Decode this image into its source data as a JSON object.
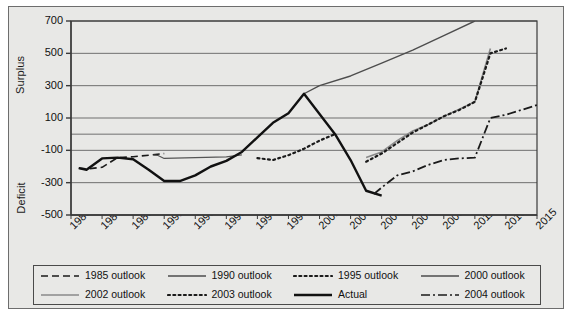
{
  "chart_data": {
    "type": "line",
    "title": "",
    "xlabel": "",
    "ylabel": "Surplus / Deficit",
    "axis_titles": {
      "upper": "Surplus",
      "lower": "Deficit"
    },
    "grid": true,
    "legend_position": "bottom",
    "xlim": [
      1985,
      2015
    ],
    "ylim": [
      -500,
      700
    ],
    "ytick_labels": [
      "700",
      "500",
      "300",
      "100",
      "-100",
      "-300",
      "-500"
    ],
    "ytick_values": [
      700,
      500,
      300,
      100,
      -100,
      -300,
      -500
    ],
    "zero_gridline": 0,
    "xtick_labels": [
      "1985",
      "1987",
      "1989",
      "1991",
      "1993",
      "1995",
      "1997",
      "1999",
      "2001",
      "2003",
      "2005",
      "2007",
      "2009",
      "2011",
      "2013",
      "2015"
    ],
    "xtick_values": [
      1985,
      1987,
      1989,
      1991,
      1993,
      1995,
      1997,
      1999,
      2001,
      2003,
      2005,
      2007,
      2009,
      2011,
      2013,
      2015
    ],
    "series": [
      {
        "name": "1985 outlook",
        "style": "dashed",
        "color": "#1a1a1a",
        "width": 1.6,
        "x": [
          1985.5,
          1986,
          1987,
          1988,
          1989,
          1990,
          1991
        ],
        "values": [
          -210,
          -215,
          -205,
          -145,
          -140,
          -130,
          -120
        ]
      },
      {
        "name": "1990 outlook",
        "style": "solid",
        "color": "#555555",
        "width": 1.2,
        "x": [
          1990.3,
          1990.6,
          1991,
          1993,
          1995,
          1996
        ],
        "values": [
          -130,
          -132,
          -150,
          -145,
          -140,
          -128
        ]
      },
      {
        "name": "1995 outlook",
        "style": "dotted",
        "color": "#1a1a1a",
        "width": 2.2,
        "x": [
          1997,
          1998,
          1999,
          2000,
          2001,
          2002
        ],
        "values": [
          -148,
          -160,
          -130,
          -90,
          -40,
          0
        ]
      },
      {
        "name": "2000 outlook",
        "style": "solid",
        "color": "#4d4d4d",
        "width": 1.4,
        "x": [
          2000,
          2001,
          2003,
          2005,
          2007,
          2009,
          2011
        ],
        "values": [
          250,
          300,
          360,
          440,
          520,
          610,
          700
        ]
      },
      {
        "name": "2002 outlook",
        "style": "solid",
        "color": "#8a8a8a",
        "width": 1.6,
        "x": [
          2004,
          2005,
          2006,
          2007,
          2008,
          2009,
          2010,
          2011,
          2012
        ],
        "values": [
          -145,
          -110,
          -40,
          20,
          60,
          110,
          155,
          200,
          530
        ]
      },
      {
        "name": "2003 outlook",
        "style": "dotted",
        "color": "#1a1a1a",
        "width": 2.2,
        "x": [
          2004,
          2005,
          2006,
          2007,
          2008,
          2009,
          2010,
          2011,
          2012,
          2013
        ],
        "values": [
          -170,
          -120,
          -55,
          10,
          60,
          110,
          150,
          200,
          500,
          530
        ]
      },
      {
        "name": "Actual",
        "style": "solid",
        "color": "#111111",
        "width": 2.4,
        "x": [
          1985.5,
          1986,
          1987,
          1988,
          1989,
          1990,
          1991,
          1992,
          1993,
          1994,
          1995,
          1996,
          1997,
          1998,
          1999,
          2000,
          2001,
          2002,
          2003,
          2004,
          2005
        ],
        "values": [
          -210,
          -220,
          -150,
          -145,
          -155,
          -220,
          -290,
          -290,
          -255,
          -200,
          -165,
          -110,
          -20,
          70,
          130,
          250,
          125,
          0,
          -160,
          -350,
          -380
        ]
      },
      {
        "name": "2004 outlook",
        "style": "dashdot",
        "color": "#1a1a1a",
        "width": 1.8,
        "x": [
          2004.5,
          2005,
          2006,
          2007,
          2008,
          2009,
          2010,
          2011,
          2012,
          2013,
          2014,
          2015
        ],
        "values": [
          -370,
          -330,
          -255,
          -230,
          -190,
          -160,
          -150,
          -145,
          100,
          120,
          150,
          180
        ]
      }
    ]
  },
  "legend": {
    "items": [
      {
        "label": "1985 outlook",
        "style": "dashed",
        "color": "#1a1a1a"
      },
      {
        "label": "1990 outlook",
        "style": "solid",
        "color": "#4d4d4d"
      },
      {
        "label": "1995 outlook",
        "style": "dotted",
        "color": "#1a1a1a"
      },
      {
        "label": "2000 outlook",
        "style": "solid",
        "color": "#4d4d4d"
      },
      {
        "label": "2002 outlook",
        "style": "solid",
        "color": "#8a8a8a"
      },
      {
        "label": "2003 outlook",
        "style": "dotted",
        "color": "#1a1a1a"
      },
      {
        "label": "Actual",
        "style": "solid",
        "color": "#111111"
      },
      {
        "label": "2004 outlook",
        "style": "dashdot",
        "color": "#1a1a1a"
      }
    ]
  },
  "colors": {
    "panel_background": "#e8e8e6",
    "panel_border": "#6d6d6d",
    "grid": "#6f6f6f",
    "axis": "#3a3a3a",
    "text": "#111111"
  }
}
